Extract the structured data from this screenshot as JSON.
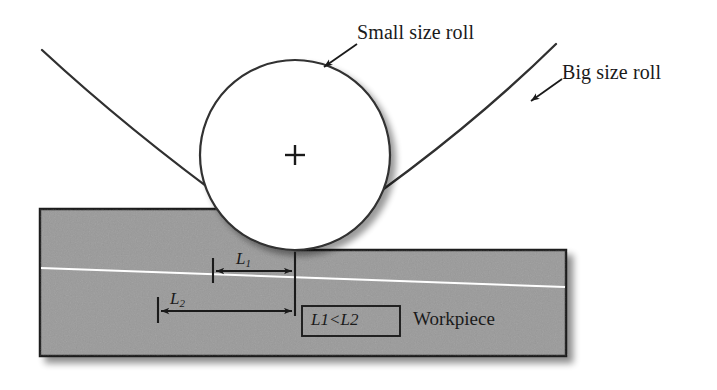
{
  "figure": {
    "background_color": "#ffffff",
    "ink_color": "#2b2b2b",
    "workpiece_fill": "#9a9a9a",
    "workpiece_edge": "#1c1c1c",
    "roll_fill": "#ffffff"
  },
  "callouts": [
    {
      "id": "small-roll",
      "label": "Small size roll",
      "leader_from": [
        355,
        45
      ],
      "leader_to": [
        322,
        68
      ]
    },
    {
      "id": "big-roll",
      "label": "Big size roll",
      "leader_from": [
        560,
        78
      ],
      "leader_to": [
        530,
        100
      ]
    }
  ],
  "labels": {
    "small_roll": "Small size roll",
    "big_roll": "Big size roll",
    "workpiece": "Workpiece",
    "l1": "L",
    "l1_sub": "1",
    "l2": "L",
    "l2_sub": "2",
    "inequality_left": "L",
    "inequality_left_sub": "1",
    "inequality_op": "<",
    "inequality_right": "L",
    "inequality_right_sub": "2"
  },
  "dimensions": [
    {
      "name": "L1",
      "label": "L1",
      "meaning": "contact length of small size roll",
      "x_start": 213,
      "x_end": 295,
      "y": 271,
      "pixel_length": 82
    },
    {
      "name": "L2",
      "label": "L2",
      "meaning": "contact length of big size roll",
      "x_start": 158,
      "x_end": 295,
      "y": 311,
      "pixel_length": 137
    }
  ],
  "relation": "L1 < L2",
  "geometry": {
    "small_roll": {
      "center_x": 295,
      "center_y": 155,
      "radius": 95,
      "center_marker": "plus"
    },
    "big_roll": {
      "contact_x": 295,
      "contact_y": 250,
      "left_arc_start": [
        42,
        50
      ],
      "right_arc_end": [
        556,
        44
      ],
      "radius_estimate": 420
    },
    "workpiece": {
      "left_x": 40,
      "right_x": 566,
      "top_left_y": 209,
      "top_right_y": 250,
      "bottom_y": 356,
      "neutral_line_left": [
        40,
        268
      ],
      "neutral_line_right": [
        566,
        287
      ]
    },
    "inequality_box": {
      "x": 302,
      "y": 306,
      "width": 98,
      "height": 30
    }
  }
}
